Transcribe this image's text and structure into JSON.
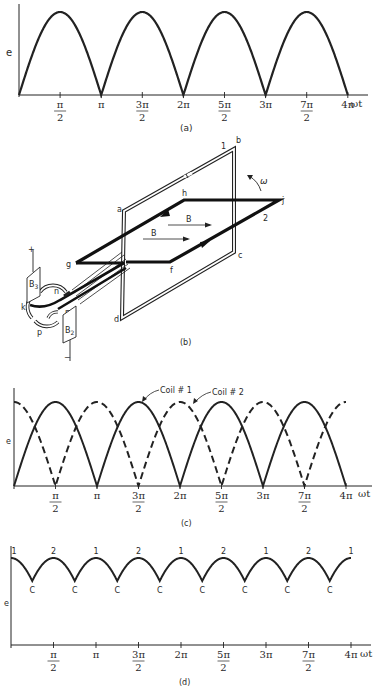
{
  "figure": {
    "ink_color": "#222222",
    "background": "#ffffff"
  },
  "panel_a": {
    "label": "(a)",
    "ylabel": "e",
    "xlabel": "ωt",
    "ticks": [
      {
        "num": "π",
        "den": "2"
      },
      {
        "num": "π",
        "den": ""
      },
      {
        "num": "3π",
        "den": "2"
      },
      {
        "num": "2π",
        "den": ""
      },
      {
        "num": "5π",
        "den": "2"
      },
      {
        "num": "3π",
        "den": ""
      },
      {
        "num": "7π",
        "den": "2"
      },
      {
        "num": "4π",
        "den": ""
      }
    ]
  },
  "panel_b": {
    "label": "(b)",
    "coil1_labels": {
      "a": "a",
      "b": "b",
      "c": "c",
      "d": "d",
      "one": "1"
    },
    "coil2_labels": {
      "f": "f",
      "g": "g",
      "h": "h",
      "j": "j",
      "two": "2"
    },
    "field_label": "B",
    "omega_label": "ω",
    "commutator_labels": {
      "k": "k",
      "m": "m",
      "n": "n",
      "p": "p"
    },
    "brush_top": {
      "name": "B",
      "sub": "3",
      "polarity": "+"
    },
    "brush_bottom": {
      "name": "B",
      "sub": "2",
      "polarity": "−"
    }
  },
  "panel_c": {
    "label": "(c)",
    "ylabel": "e",
    "xlabel": "ωt",
    "legend": [
      {
        "name": "Coil # 1",
        "style": "solid"
      },
      {
        "name": "Coil # 2",
        "style": "dashed"
      }
    ],
    "ticks": [
      {
        "num": "π",
        "den": "2"
      },
      {
        "num": "π",
        "den": ""
      },
      {
        "num": "3π",
        "den": "2"
      },
      {
        "num": "2π",
        "den": ""
      },
      {
        "num": "5π",
        "den": "2"
      },
      {
        "num": "3π",
        "den": ""
      },
      {
        "num": "7π",
        "den": "2"
      },
      {
        "num": "4π",
        "den": ""
      }
    ]
  },
  "panel_d": {
    "label": "(d)",
    "ylabel": "e",
    "xlabel": "ωt",
    "peak_labels": [
      "1",
      "2",
      "1",
      "2",
      "1",
      "2",
      "1",
      "2",
      "1"
    ],
    "trough_label": "C",
    "ticks": [
      {
        "num": "π",
        "den": "2"
      },
      {
        "num": "π",
        "den": ""
      },
      {
        "num": "3π",
        "den": "2"
      },
      {
        "num": "2π",
        "den": ""
      },
      {
        "num": "5π",
        "den": "2"
      },
      {
        "num": "3π",
        "den": ""
      },
      {
        "num": "7π",
        "den": "2"
      },
      {
        "num": "4π",
        "den": ""
      }
    ]
  },
  "chart_data": [
    {
      "type": "line",
      "title": "(a) Rectified EMF of single coil",
      "xlabel": "ωt",
      "ylabel": "e",
      "x_ticks": [
        "π/2",
        "π",
        "3π/2",
        "2π",
        "5π/2",
        "3π",
        "7π/2",
        "4π"
      ],
      "xlim": [
        0,
        12.566
      ],
      "series": [
        {
          "name": "Coil",
          "style": "solid",
          "function": "|sin(ωt)|"
        }
      ],
      "ylim": [
        0,
        1
      ]
    },
    {
      "type": "line",
      "title": "(c) EMF of two coils 90° apart",
      "xlabel": "ωt",
      "ylabel": "e",
      "x_ticks": [
        "π/2",
        "π",
        "3π/2",
        "2π",
        "5π/2",
        "3π",
        "7π/2",
        "4π"
      ],
      "xlim": [
        0,
        12.566
      ],
      "series": [
        {
          "name": "Coil # 1",
          "style": "solid",
          "function": "|sin(ωt)|"
        },
        {
          "name": "Coil # 2",
          "style": "dashed",
          "function": "|cos(ωt)|"
        }
      ],
      "ylim": [
        0,
        1
      ]
    },
    {
      "type": "line",
      "title": "(d) Resultant commutated EMF",
      "xlabel": "ωt",
      "ylabel": "e",
      "x_ticks": [
        "π/2",
        "π",
        "3π/2",
        "2π",
        "5π/2",
        "3π",
        "7π/2",
        "4π"
      ],
      "xlim": [
        0,
        12.566
      ],
      "series": [
        {
          "name": "Output",
          "style": "solid",
          "function": "max(|sin ωt|, |cos ωt|)"
        }
      ],
      "peak_labels": [
        "1",
        "2",
        "1",
        "2",
        "1",
        "2",
        "1",
        "2",
        "1"
      ],
      "trough_label": "C",
      "ylim": [
        0,
        1
      ]
    }
  ]
}
